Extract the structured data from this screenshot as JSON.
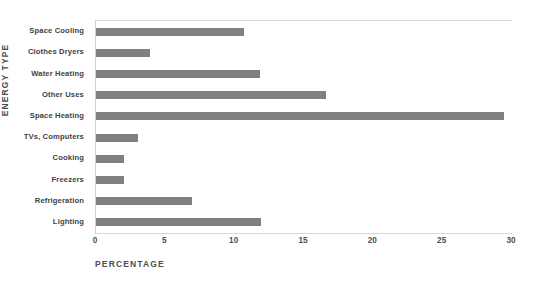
{
  "chart_data": {
    "type": "bar",
    "orientation": "horizontal",
    "title": "",
    "xlabel": "PERCENTAGE",
    "ylabel": "ENERGY TYPE",
    "categories": [
      "Space Cooling",
      "Clothes Dryers",
      "Water Heating",
      "Other Uses",
      "Space Heating",
      "TVs, Computers",
      "Cooking",
      "Freezers",
      "Refrigeration",
      "Lighting"
    ],
    "values": [
      10.7,
      3.9,
      11.8,
      16.6,
      29.4,
      3.0,
      2.0,
      2.0,
      6.9,
      11.9
    ],
    "xlim": [
      0,
      30
    ],
    "xticks": [
      "0",
      "5",
      "10",
      "15",
      "20",
      "25",
      "30"
    ],
    "xtick_values": [
      0,
      5,
      10,
      15,
      20,
      25,
      30
    ],
    "grid": false,
    "legend": false,
    "bar_color": "#808080",
    "axis_color": "#d8d8d8",
    "text_color": "#4d4d4d"
  }
}
